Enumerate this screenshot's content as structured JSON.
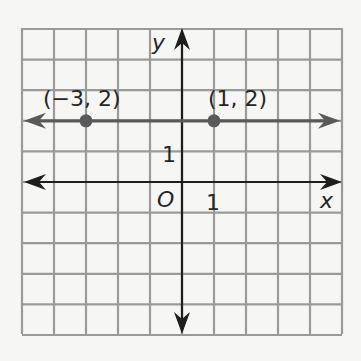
{
  "diagram": {
    "type": "coordinate-plane",
    "grid": {
      "x_min": -5,
      "x_max": 5,
      "y_min": -5,
      "y_max": 5,
      "step": 1,
      "grid_color": "#9a9a9a",
      "background": "#f6f6f4"
    },
    "axes": {
      "x_label": "x",
      "y_label": "y",
      "origin_label": "O",
      "x_tick_label": "1",
      "y_tick_label": "1",
      "axis_color": "#1e1e1e"
    },
    "line": {
      "description": "horizontal line y = 2",
      "equation": "y = 2",
      "color": "#5a5a5a"
    },
    "points": [
      {
        "label": "(−3, 2)",
        "x": -3,
        "y": 2
      },
      {
        "label": "(1, 2)",
        "x": 1,
        "y": 2
      }
    ]
  }
}
